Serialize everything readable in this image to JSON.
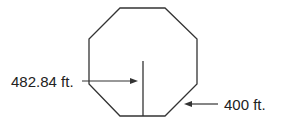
{
  "diagram": {
    "shape": "regular octagon",
    "labels": {
      "apothem_label": "482.84 ft.",
      "side_label": "400 ft."
    },
    "colors": {
      "stroke": "#333333",
      "text": "#222222"
    }
  }
}
